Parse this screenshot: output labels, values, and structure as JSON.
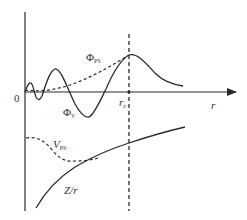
{
  "diagram": {
    "type": "pseudopotential-schematic",
    "axis": {
      "origin_label": "0",
      "x_label": "r",
      "cutoff_label": "r",
      "cutoff_subscript": "c"
    },
    "curves": [
      {
        "id": "phi_ps",
        "label": "Φ",
        "subscript": "PS",
        "style": "dashed",
        "description": "pseudo wavefunction"
      },
      {
        "id": "phi_v",
        "label": "Φ",
        "subscript": "V",
        "style": "solid",
        "description": "valence wavefunction"
      },
      {
        "id": "v_ps",
        "label": "V",
        "subscript": "PS",
        "style": "dashed",
        "description": "pseudopotential"
      },
      {
        "id": "z_over_r",
        "label": "Z/r",
        "subscript": "",
        "style": "solid",
        "description": "Coulomb potential"
      }
    ],
    "colors": {
      "line": "#2a2a2a",
      "text": "#333333",
      "background": "#ffffff"
    }
  }
}
